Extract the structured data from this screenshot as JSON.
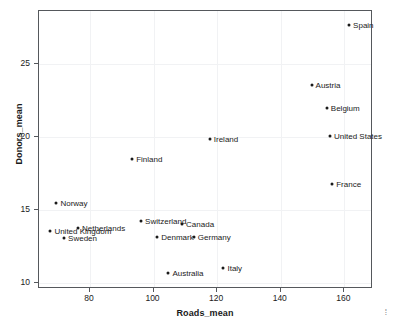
{
  "chart_data": {
    "type": "scatter",
    "title": "",
    "xlabel": "Roads_mean",
    "ylabel": "Donors_mean",
    "xlim": [
      64,
      169
    ],
    "ylim": [
      9.6,
      28.6
    ],
    "xticks": [
      80,
      100,
      120,
      140,
      160
    ],
    "yticks": [
      10,
      15,
      20,
      25
    ],
    "grid": true,
    "legend": false,
    "points": [
      {
        "label": "Spain",
        "x": 161.8,
        "y": 27.6,
        "label_side": "right"
      },
      {
        "label": "Austria",
        "x": 150.0,
        "y": 23.5,
        "label_side": "right"
      },
      {
        "label": "Belgium",
        "x": 154.8,
        "y": 21.9,
        "label_side": "right"
      },
      {
        "label": "United States",
        "x": 155.8,
        "y": 20.0,
        "label_side": "right"
      },
      {
        "label": "Ireland",
        "x": 118.0,
        "y": 19.8,
        "label_side": "right"
      },
      {
        "label": "Finland",
        "x": 93.6,
        "y": 18.4,
        "label_side": "right"
      },
      {
        "label": "France",
        "x": 156.5,
        "y": 16.7,
        "label_side": "right"
      },
      {
        "label": "Norway",
        "x": 69.8,
        "y": 15.4,
        "label_side": "right"
      },
      {
        "label": "Switzerland",
        "x": 96.4,
        "y": 14.2,
        "label_side": "right"
      },
      {
        "label": "Canada",
        "x": 109.3,
        "y": 14.0,
        "label_side": "right"
      },
      {
        "label": "Netherlands",
        "x": 76.6,
        "y": 13.7,
        "label_side": "right"
      },
      {
        "label": "United Kingdom",
        "x": 67.9,
        "y": 13.5,
        "label_side": "right"
      },
      {
        "label": "Denmark",
        "x": 101.5,
        "y": 13.1,
        "label_side": "right"
      },
      {
        "label": "Germany",
        "x": 113.0,
        "y": 13.1,
        "label_side": "right"
      },
      {
        "label": "Sweden",
        "x": 72.2,
        "y": 13.0,
        "label_side": "right"
      },
      {
        "label": "Italy",
        "x": 122.3,
        "y": 11.0,
        "label_side": "right"
      },
      {
        "label": "Australia",
        "x": 105.0,
        "y": 10.6,
        "label_side": "right"
      }
    ]
  },
  "axes": {
    "x_title": "Roads_mean",
    "y_title": "Donors_mean",
    "x_tick_labels": [
      "80",
      "100",
      "120",
      "140",
      "160"
    ],
    "y_tick_labels": [
      "10",
      "15",
      "20",
      "25"
    ]
  },
  "style": {
    "point_color": "#1a1a1a",
    "grid_color": "#f1f2f4",
    "frame_color": "#55585c",
    "text_color": "#1a1a1a",
    "background": "#ffffff"
  },
  "corner_mark": "⦙"
}
